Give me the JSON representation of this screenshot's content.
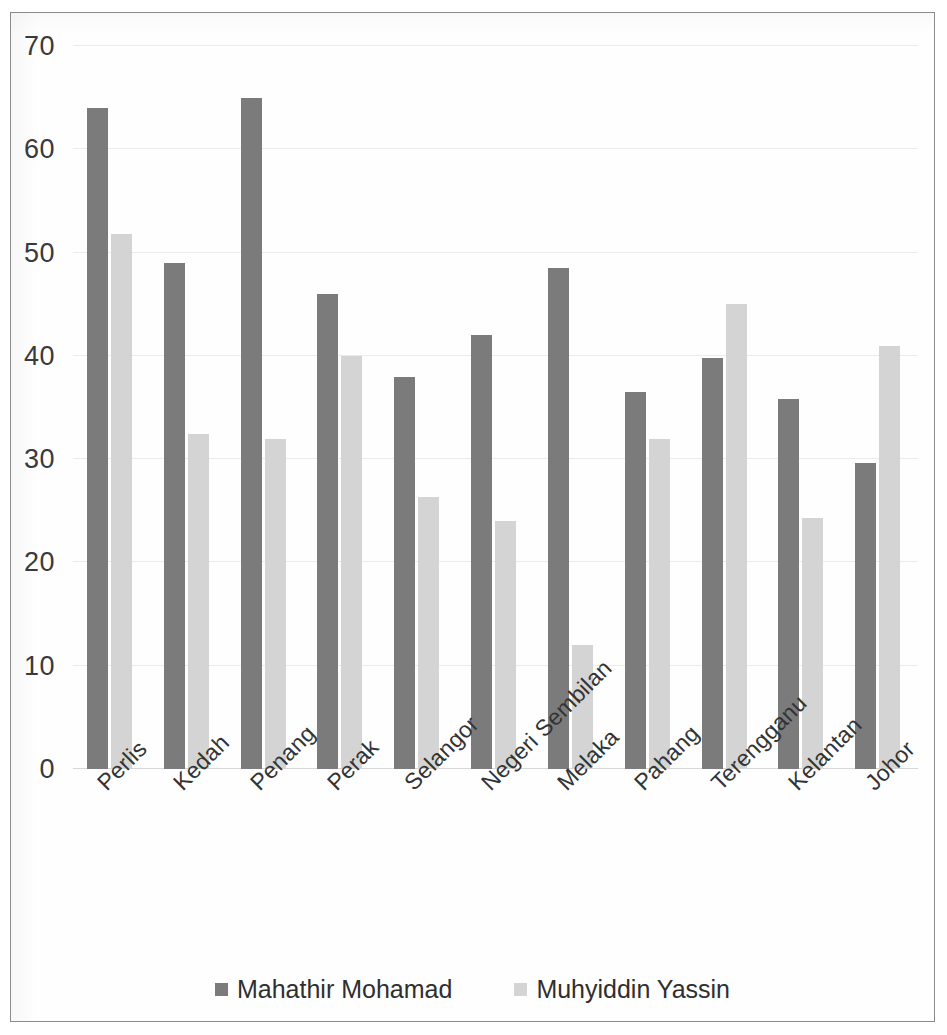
{
  "chart_data": {
    "type": "bar",
    "title": "",
    "subtitle": "",
    "xlabel": "",
    "ylabel": "",
    "ylim": [
      0,
      70
    ],
    "y_ticks": [
      0,
      10,
      20,
      30,
      40,
      50,
      60,
      70
    ],
    "grid": true,
    "legend_position": "bottom",
    "categories": [
      "Perlis",
      "Kedah",
      "Penang",
      "Perak",
      "Selangor",
      "Negeri Sembilan",
      "Melaka",
      "Pahang",
      "Terengganu",
      "Kelantan",
      "Johor"
    ],
    "series": [
      {
        "name": "Mahathir Mohamad",
        "color": "#7b7b7b",
        "values": [
          64,
          49,
          65,
          46,
          38,
          42,
          48.5,
          36.5,
          39.8,
          35.8,
          29.6
        ]
      },
      {
        "name": "Muhyiddin Yassin",
        "color": "#d4d4d4",
        "values": [
          51.8,
          32.4,
          32,
          40,
          26.3,
          24,
          12,
          32,
          45,
          24.3,
          41
        ]
      }
    ]
  },
  "legend": {
    "items": [
      {
        "label": "Mahathir Mohamad",
        "color": "#7b7b7b"
      },
      {
        "label": "Muhyiddin Yassin",
        "color": "#d4d4d4"
      }
    ]
  }
}
